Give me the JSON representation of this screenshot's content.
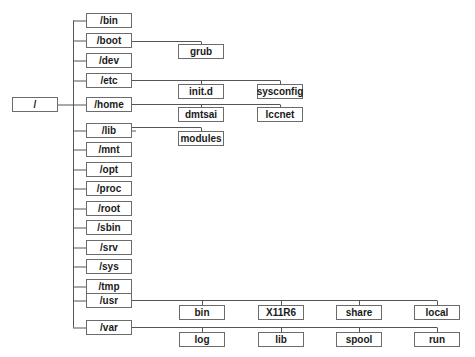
{
  "diagram": {
    "line_color": "#555555",
    "border_color": "#6b6b6b",
    "root": {
      "label": "/",
      "x": 12,
      "y": 97,
      "w": 46,
      "h": 15
    },
    "spine_x": 73,
    "level1": [
      {
        "label": "/bin",
        "y": 13
      },
      {
        "label": "/boot",
        "y": 33
      },
      {
        "label": "/dev",
        "y": 53
      },
      {
        "label": "/etc",
        "y": 73
      },
      {
        "label": "/home",
        "y": 97
      },
      {
        "label": "/lib",
        "y": 123
      },
      {
        "label": "/mnt",
        "y": 142
      },
      {
        "label": "/opt",
        "y": 162
      },
      {
        "label": "/proc",
        "y": 181
      },
      {
        "label": "/root",
        "y": 201
      },
      {
        "label": "/sbin",
        "y": 220
      },
      {
        "label": "/srv",
        "y": 240
      },
      {
        "label": "/sys",
        "y": 259
      },
      {
        "label": "/tmp",
        "y": 279
      },
      {
        "label": "/usr",
        "y": 293
      },
      {
        "label": "/var",
        "y": 320
      }
    ],
    "level1_box": {
      "x": 86,
      "w": 46,
      "h": 15
    },
    "children": [
      {
        "parent": 1,
        "line_y": 41,
        "box_y": 44,
        "items": [
          {
            "label": "grub",
            "x": 178
          }
        ]
      },
      {
        "parent": 3,
        "line_y": 80,
        "box_y": 84,
        "items": [
          {
            "label": "init.d",
            "x": 178
          },
          {
            "label": "sysconfig",
            "x": 257
          }
        ]
      },
      {
        "parent": 4,
        "line_y": 104,
        "box_y": 107,
        "items": [
          {
            "label": "dmtsai",
            "x": 178
          },
          {
            "label": "lccnet",
            "x": 257
          }
        ]
      },
      {
        "parent": 5,
        "line_y": 127,
        "box_y": 131,
        "items": [
          {
            "label": "modules",
            "x": 178
          }
        ]
      },
      {
        "parent": 14,
        "line_y": 300,
        "box_y": 305,
        "items": [
          {
            "label": "bin",
            "x": 179
          },
          {
            "label": "X11R6",
            "x": 258
          },
          {
            "label": "share",
            "x": 336
          },
          {
            "label": "local",
            "x": 414
          }
        ]
      },
      {
        "parent": 15,
        "line_y": 327,
        "box_y": 332,
        "items": [
          {
            "label": "log",
            "x": 179
          },
          {
            "label": "lib",
            "x": 258
          },
          {
            "label": "spool",
            "x": 336
          },
          {
            "label": "run",
            "x": 414
          }
        ]
      }
    ],
    "child_box": {
      "w": 46,
      "h": 15
    }
  }
}
